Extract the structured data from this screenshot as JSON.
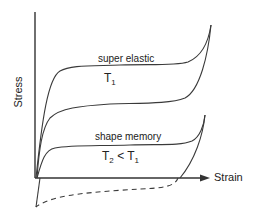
{
  "diagram": {
    "axes": {
      "y_label": "Stress",
      "x_label": "Strain"
    },
    "curves": [
      {
        "name": "super-elastic-loading",
        "style": "solid"
      },
      {
        "name": "super-elastic-unloading",
        "style": "solid"
      },
      {
        "name": "shape-memory-loading",
        "style": "solid"
      },
      {
        "name": "shape-memory-unloading",
        "style": "solid"
      },
      {
        "name": "shape-memory-reverse",
        "style": "dashed"
      }
    ],
    "labels": {
      "super_elastic": "super elastic",
      "t1_main": "T",
      "t1_sub": "1",
      "shape_memory": "shape memory",
      "t2_main": "T",
      "t2_sub": "2",
      "lt": " < ",
      "t1b_main": "T",
      "t1b_sub": "1"
    },
    "colors": {
      "line": "#3a3a3a",
      "axis": "#333333"
    }
  }
}
